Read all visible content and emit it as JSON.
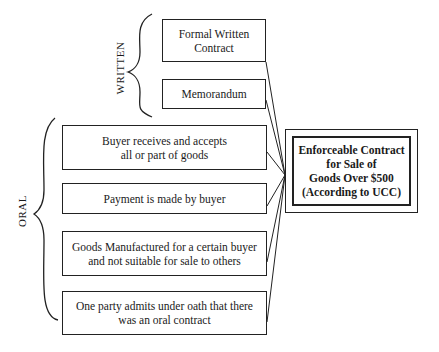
{
  "groups": {
    "written": {
      "label": "WRITTEN",
      "items": [
        {
          "text": "Formal Written\nContract"
        },
        {
          "text": "Memorandum"
        }
      ]
    },
    "oral": {
      "label": "ORAL",
      "items": [
        {
          "text": "Buyer receives and accepts\nall or part of goods"
        },
        {
          "text": "Payment is made by buyer"
        },
        {
          "text": "Goods Manufactured for a certain buyer\nand not suitable for sale to others"
        },
        {
          "text": "One party admits under oath that there\nwas an oral contract"
        }
      ]
    }
  },
  "target": {
    "text": "Enforceable Contract\nfor Sale of\nGoods Over $500\n(According to UCC)"
  }
}
